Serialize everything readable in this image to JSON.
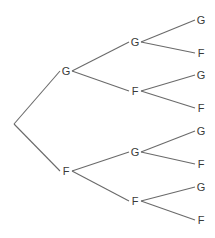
{
  "diagram": {
    "type": "probability-tree",
    "levels": 3,
    "colors": {
      "line": "#6a6a6a",
      "text": "#3a3a3a",
      "background": "#ffffff"
    },
    "root": {
      "x": 14,
      "y": 124
    },
    "nodes": [
      {
        "id": "L1-G",
        "label": "G",
        "x": 66,
        "y": 71,
        "parent": "root"
      },
      {
        "id": "L1-F",
        "label": "F",
        "x": 66,
        "y": 171,
        "parent": "root"
      },
      {
        "id": "L2-GG",
        "label": "G",
        "x": 135,
        "y": 42,
        "parent": "L1-G"
      },
      {
        "id": "L2-GF",
        "label": "F",
        "x": 135,
        "y": 91,
        "parent": "L1-G"
      },
      {
        "id": "L2-FG",
        "label": "G",
        "x": 135,
        "y": 152,
        "parent": "L1-F"
      },
      {
        "id": "L2-FF",
        "label": "F",
        "x": 135,
        "y": 201,
        "parent": "L1-F"
      },
      {
        "id": "L3-GGG",
        "label": "G",
        "x": 201,
        "y": 20,
        "parent": "L2-GG"
      },
      {
        "id": "L3-GGF",
        "label": "F",
        "x": 201,
        "y": 53,
        "parent": "L2-GG"
      },
      {
        "id": "L3-GFG",
        "label": "G",
        "x": 201,
        "y": 75,
        "parent": "L2-GF"
      },
      {
        "id": "L3-GFF",
        "label": "F",
        "x": 201,
        "y": 108,
        "parent": "L2-GF"
      },
      {
        "id": "L3-FGG",
        "label": "G",
        "x": 201,
        "y": 131,
        "parent": "L2-FG"
      },
      {
        "id": "L3-FGF",
        "label": "F",
        "x": 201,
        "y": 164,
        "parent": "L2-FG"
      },
      {
        "id": "L3-FFG",
        "label": "G",
        "x": 201,
        "y": 187,
        "parent": "L2-FF"
      },
      {
        "id": "L3-FFF",
        "label": "F",
        "x": 201,
        "y": 220,
        "parent": "L2-FF"
      }
    ]
  }
}
